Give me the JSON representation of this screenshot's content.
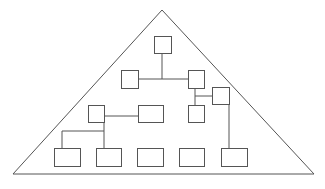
{
  "diagram": {
    "type": "hierarchy-in-pyramid",
    "colors": {
      "stroke": "#555555",
      "background": "#ffffff"
    },
    "pyramid": {
      "apex": [
        162,
        10
      ],
      "left": [
        13,
        174
      ],
      "right": [
        314,
        174
      ]
    },
    "nodes": [
      {
        "id": "n-top",
        "x": 154,
        "y": 36,
        "w": 17,
        "h": 17
      },
      {
        "id": "n-r2-left",
        "x": 121,
        "y": 70,
        "w": 17,
        "h": 18
      },
      {
        "id": "n-r2-right",
        "x": 188,
        "y": 70,
        "w": 16,
        "h": 18
      },
      {
        "id": "n-side",
        "x": 212,
        "y": 87,
        "w": 17,
        "h": 17
      },
      {
        "id": "n-r3-left",
        "x": 88,
        "y": 105,
        "w": 16,
        "h": 17
      },
      {
        "id": "n-r3-mid",
        "x": 138,
        "y": 105,
        "w": 25,
        "h": 17
      },
      {
        "id": "n-r3-right",
        "x": 188,
        "y": 105,
        "w": 16,
        "h": 17
      },
      {
        "id": "n-b1",
        "x": 54,
        "y": 148,
        "w": 26,
        "h": 18
      },
      {
        "id": "n-b2",
        "x": 96,
        "y": 148,
        "w": 25,
        "h": 18
      },
      {
        "id": "n-b3",
        "x": 137,
        "y": 148,
        "w": 26,
        "h": 18
      },
      {
        "id": "n-b4",
        "x": 179,
        "y": 148,
        "w": 25,
        "h": 18
      },
      {
        "id": "n-b5",
        "x": 221,
        "y": 148,
        "w": 26,
        "h": 18
      }
    ],
    "connectors": [
      {
        "points": [
          [
            162,
            53
          ],
          [
            162,
            79
          ]
        ]
      },
      {
        "points": [
          [
            138,
            79
          ],
          [
            188,
            79
          ]
        ]
      },
      {
        "points": [
          [
            195,
            88
          ],
          [
            195,
            105
          ]
        ]
      },
      {
        "points": [
          [
            195,
            96
          ],
          [
            212,
            96
          ]
        ]
      },
      {
        "points": [
          [
            229,
            104
          ],
          [
            229,
            148
          ]
        ]
      },
      {
        "points": [
          [
            104,
            116
          ],
          [
            138,
            116
          ]
        ]
      },
      {
        "points": [
          [
            104,
            122
          ],
          [
            104,
            148
          ]
        ]
      },
      {
        "points": [
          [
            62,
            131
          ],
          [
            104,
            131
          ]
        ]
      },
      {
        "points": [
          [
            62,
            131
          ],
          [
            62,
            148
          ]
        ]
      }
    ]
  }
}
